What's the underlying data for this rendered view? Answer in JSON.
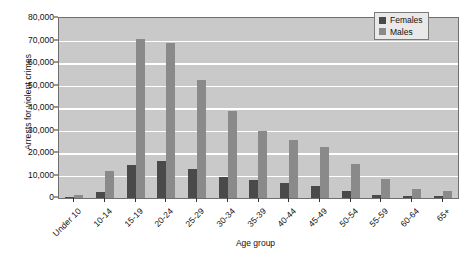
{
  "chart_data": {
    "type": "bar",
    "title": "",
    "xlabel": "Age group",
    "ylabel": "Arrests for violent crimes",
    "ylim": [
      0,
      80000
    ],
    "ytick_labels": [
      "80,000",
      "70,000",
      "60,000",
      "50,000",
      "40,000",
      "30,000",
      "20,000",
      "10,000",
      "0"
    ],
    "ytick_values": [
      80000,
      70000,
      60000,
      50000,
      40000,
      30000,
      20000,
      10000,
      0
    ],
    "grid": true,
    "legend_position": "top-right",
    "categories": [
      "Under 10",
      "10-14",
      "15-19",
      "20-24",
      "25-29",
      "30-34",
      "35-39",
      "40-44",
      "45-49",
      "50-54",
      "55-59",
      "60-64",
      "65+"
    ],
    "series": [
      {
        "name": "Females",
        "color": "#4a4a4a",
        "values": [
          500,
          2500,
          14500,
          16500,
          13000,
          9500,
          8000,
          6500,
          5500,
          3000,
          1500,
          1000,
          700
        ]
      },
      {
        "name": "Males",
        "color": "#8a8a8a",
        "values": [
          1500,
          12000,
          70500,
          69000,
          52500,
          38500,
          30000,
          26000,
          22500,
          15000,
          8500,
          4000,
          3000
        ]
      }
    ],
    "plot_background": "#c9c9c9",
    "gridline_color": "#ffffff",
    "axis_color": "#6f6f6f"
  },
  "legend": {
    "items": [
      {
        "label": "Females",
        "swatch": "#4a4a4a"
      },
      {
        "label": "Males",
        "swatch": "#8a8a8a"
      }
    ]
  }
}
